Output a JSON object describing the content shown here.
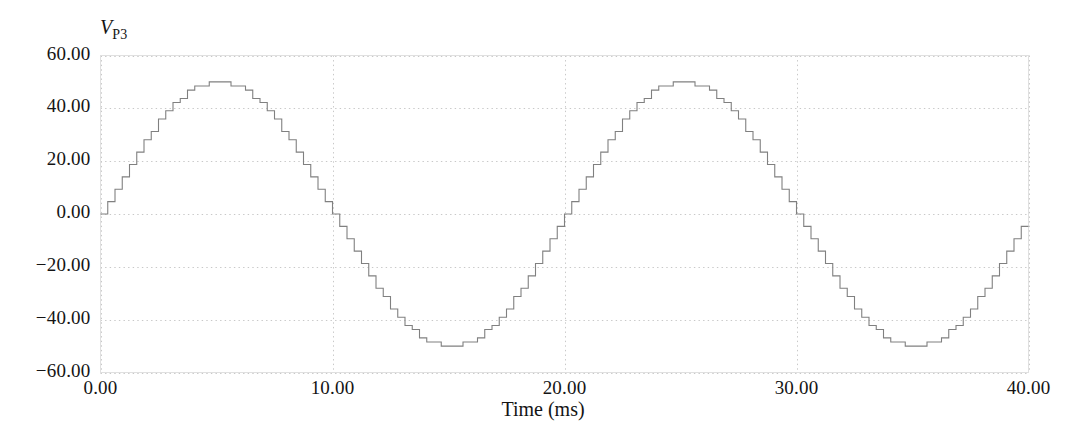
{
  "chart_data": {
    "type": "line",
    "title": "",
    "subtitle": "",
    "xlabel": "Time (ms)",
    "ylabel": "V_P3",
    "ylabel_symbol": "V",
    "ylabel_subscript": "P3",
    "xlim": [
      0.0,
      40.0
    ],
    "ylim": [
      -60.0,
      60.0
    ],
    "xticks": [
      0.0,
      10.0,
      20.0,
      30.0,
      40.0
    ],
    "xtick_labels": [
      "0.00",
      "10.00",
      "20.00",
      "30.00",
      "40.00"
    ],
    "yticks": [
      60.0,
      40.0,
      20.0,
      0.0,
      -20.0,
      -40.0,
      -60.0
    ],
    "ytick_labels": [
      "60.00",
      "40.00",
      "20.00",
      "0.00",
      "−20.00",
      "−40.00",
      "−60.00"
    ],
    "grid": true,
    "grid_style": "dotted",
    "grid_color": "#c8c8c8",
    "legend": null,
    "legend_position": "none",
    "waveform": {
      "description": "Quantized stepped sine wave (DAC staircase output)",
      "amplitude": 50.0,
      "offset": 0.0,
      "period_ms": 20.0,
      "frequency_hz": 50.0,
      "steps_per_period": 64,
      "step_duration_ms": 0.3125,
      "quantization_levels": 32,
      "level_step": 3.125,
      "interpolation": "step-post",
      "line_color": "#808080",
      "line_width": 1.0,
      "start_value": 0.0,
      "end_value": 0.0,
      "peak_value": 50.0,
      "trough_value": -50.0,
      "peak_times_ms": [
        5.0,
        25.0
      ],
      "trough_times_ms": [
        15.0,
        35.0
      ],
      "zero_crossings_ms": [
        0.0,
        10.0,
        20.0,
        30.0,
        40.0
      ]
    },
    "series": [
      {
        "name": "V_P3",
        "color": "#808080",
        "x": [
          0.0,
          0.3125,
          0.625,
          0.9375,
          1.25,
          1.5625,
          1.875,
          2.1875,
          2.5,
          2.8125,
          3.125,
          3.4375,
          3.75,
          4.0625,
          4.375,
          4.6875,
          5.0,
          5.3125,
          5.625,
          5.9375,
          6.25,
          6.5625,
          6.875,
          7.1875,
          7.5,
          7.8125,
          8.125,
          8.4375,
          8.75,
          9.0625,
          9.375,
          9.6875,
          10.0,
          10.3125,
          10.625,
          10.9375,
          11.25,
          11.5625,
          11.875,
          12.1875,
          12.5,
          12.8125,
          13.125,
          13.4375,
          13.75,
          14.0625,
          14.375,
          14.6875,
          15.0,
          15.3125,
          15.625,
          15.9375,
          16.25,
          16.5625,
          16.875,
          17.1875,
          17.5,
          17.8125,
          18.125,
          18.4375,
          18.75,
          19.0625,
          19.375,
          19.6875,
          20.0
        ],
        "y": [
          0.0,
          4.88,
          9.57,
          14.06,
          18.3,
          22.23,
          25.78,
          28.91,
          31.64,
          33.98,
          35.94,
          37.5,
          38.67,
          39.45,
          39.84,
          40.0,
          40.0,
          39.84,
          39.45,
          38.67,
          37.5,
          35.94,
          33.98,
          31.64,
          28.91,
          25.78,
          22.23,
          18.3,
          14.06,
          9.57,
          4.88,
          0.0,
          0.0,
          -4.88,
          -9.57,
          -14.06,
          -18.3,
          -22.23,
          -25.78,
          -28.91,
          -31.64,
          -33.98,
          -35.94,
          -37.5,
          -38.67,
          -39.45,
          -39.84,
          -40.0,
          -40.0,
          -39.84,
          -39.45,
          -38.67,
          -37.5,
          -35.94,
          -33.98,
          -31.64,
          -28.91,
          -25.78,
          -22.23,
          -18.3,
          -14.06,
          -9.57,
          -4.88,
          0.0,
          0.0
        ],
        "note": "Displayed amplitude is 50.0; y values above are the normalized shape scaled at render time to the 50.0 peak."
      }
    ],
    "x_total_range_ms": 40.0,
    "cycles_shown": 2
  },
  "axes": {
    "frame_color": "#e3e3e3",
    "background": "#ffffff"
  }
}
